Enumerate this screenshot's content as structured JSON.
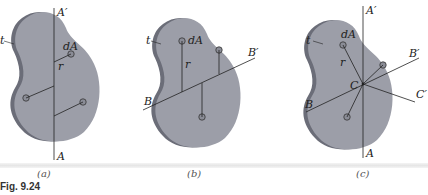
{
  "figure": {
    "caption": "Fig. 9.24",
    "colors": {
      "plate_face": "#9c9ea8",
      "plate_edge": "#6b6d78",
      "line": "#222222",
      "element": "#8a8c96"
    },
    "panels": [
      {
        "id": "a",
        "label": "(a)",
        "axes": [
          {
            "start": "A",
            "end": "A'"
          }
        ],
        "labels": {
          "thickness": "t",
          "element": "dA",
          "distance": "r"
        }
      },
      {
        "id": "b",
        "label": "(b)",
        "axes": [
          {
            "start": "B",
            "end": "B'"
          }
        ],
        "labels": {
          "thickness": "t",
          "element": "dA",
          "distance": "r"
        }
      },
      {
        "id": "c",
        "label": "(c)",
        "axes": [
          {
            "start": "A",
            "end": "A'"
          },
          {
            "start": "B",
            "end": "B'"
          },
          {
            "start": "C",
            "end": "C'"
          }
        ],
        "labels": {
          "thickness": "t",
          "element": "dA",
          "distance": "r",
          "center": "C"
        }
      }
    ]
  }
}
